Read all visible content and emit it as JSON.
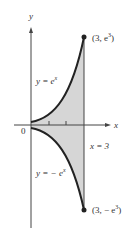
{
  "labels": {
    "y_axis": "y",
    "x_axis": "x",
    "origin": "0",
    "upper_curve": "y = e",
    "upper_curve_exp": "x",
    "lower_curve": "y = − e",
    "lower_curve_exp": "x",
    "vertical_line": "x = 3",
    "top_point": "(3, e",
    "top_point_exp": "3",
    "bottom_point": "(3, − e",
    "bottom_point_exp": "3",
    "close_paren": ")"
  },
  "colors": {
    "fill": "#d6d6d6",
    "curve": "#222222",
    "axis": "#444444"
  }
}
